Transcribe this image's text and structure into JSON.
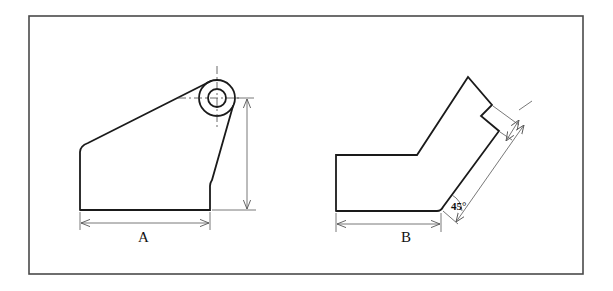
{
  "figures": [
    {
      "id": "A",
      "label": "A",
      "description": "Bracket with boss (circle) — horizontal and vertical dimensions"
    },
    {
      "id": "B",
      "label": "B",
      "description": "Angled block with notch — horizontal, 45° angle and diagonal dimensions"
    }
  ],
  "annotations": {
    "angle_label": "45°"
  },
  "colors": {
    "line": "#1a1a1a",
    "dimension": "#555555",
    "frame": "#4a4a4a",
    "background": "#ffffff"
  }
}
